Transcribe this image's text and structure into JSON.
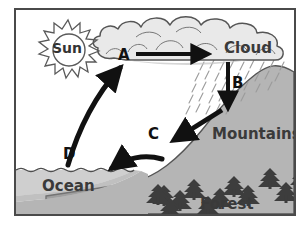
{
  "diagram": {
    "frame": {
      "border_color": "#4a4a4a",
      "background_color": "#ffffff"
    },
    "colors": {
      "sky": "#ffffff",
      "cloud_fill": "#e9e9e9",
      "cloud_outline": "#555555",
      "mountain_fill": "#b5b5b5",
      "mountain_outline": "#555555",
      "ocean_fill": "#cfcfcf",
      "seafloor_fill": "#b5b5b5",
      "ink": "#111111",
      "label_ink": "#3a3a3a",
      "rain": "#8f8f8f",
      "tree": "#3d3d3d"
    },
    "labels": {
      "sun": "Sun",
      "cloud": "Cloud",
      "mountains": "Mountains",
      "forest": "Forest",
      "ocean": "Ocean"
    },
    "markers": [
      {
        "id": "A",
        "letter": "A",
        "description": "horizontal arrow across cloud"
      },
      {
        "id": "B",
        "letter": "B",
        "description": "downward arrow from cloud into rain"
      },
      {
        "id": "C",
        "letter": "C",
        "description": "arrows running down mountain slope toward ocean"
      },
      {
        "id": "D",
        "letter": "D",
        "description": "curved arrow rising from ocean to cloud"
      }
    ],
    "features": {
      "sun_rays": 14,
      "tree_count": 15,
      "rain_visible": true,
      "wave_line_visible": true
    }
  }
}
